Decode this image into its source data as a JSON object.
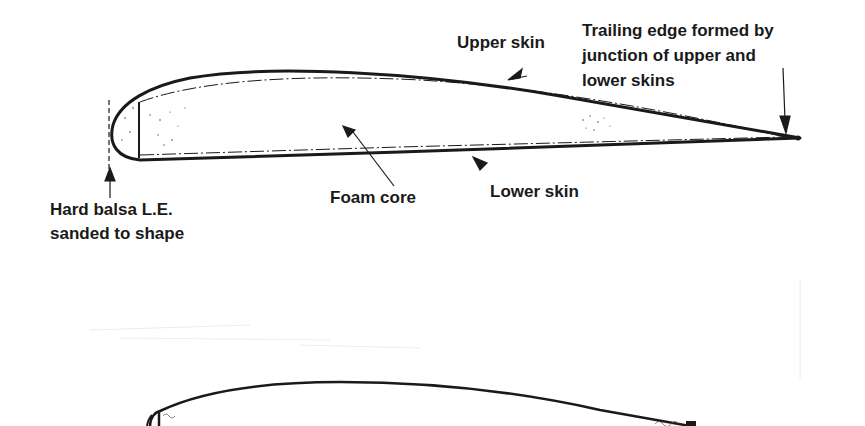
{
  "diagram": {
    "type": "airfoil-cross-section",
    "labels": {
      "upper_skin": "Upper skin",
      "trailing_edge_line1": "Trailing edge formed by",
      "trailing_edge_line2": "junction of upper and",
      "trailing_edge_line3": "lower skins",
      "foam_core": "Foam core",
      "lower_skin": "Lower skin",
      "leading_edge_line1": "Hard balsa L.E.",
      "leading_edge_line2": "sanded to shape"
    },
    "colors": {
      "ink": "#1a1a1a",
      "background": "#ffffff",
      "faint": "#e6e6e6"
    }
  }
}
